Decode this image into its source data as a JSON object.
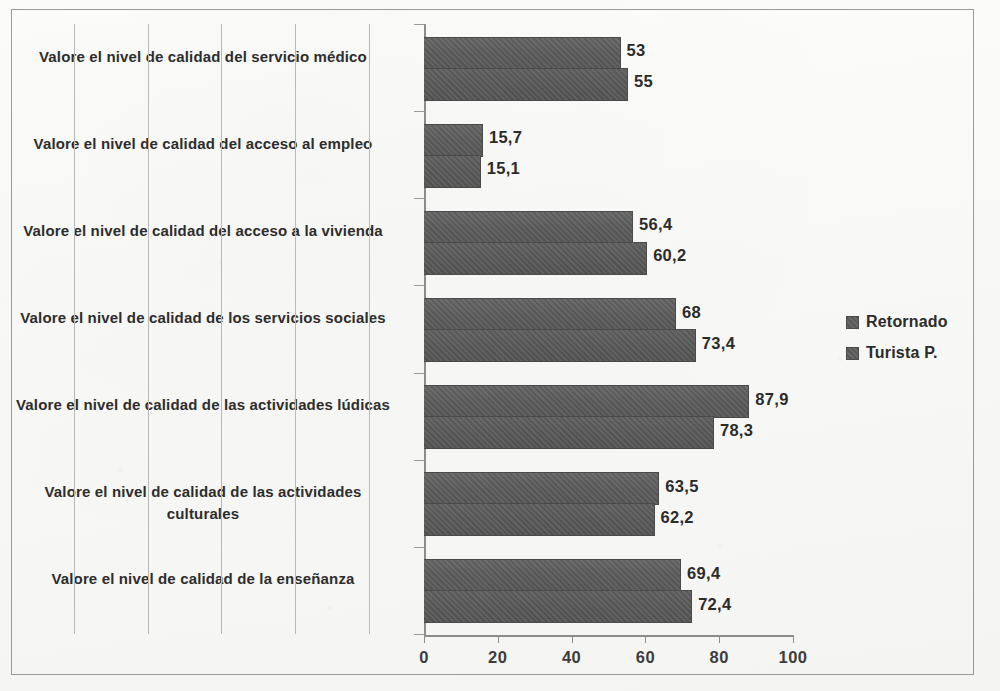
{
  "chart_data": {
    "type": "bar",
    "orientation": "horizontal",
    "title": "",
    "xlabel": "",
    "ylabel": "",
    "xlim": [
      0,
      100
    ],
    "xticks": [
      "0",
      "20",
      "40",
      "60",
      "80",
      "100"
    ],
    "grid": true,
    "legend_position": "right",
    "categories": [
      "Valore el nivel de calidad del servicio médico",
      "Valore el nivel de calidad del acceso al empleo",
      "Valore el nivel de calidad del acceso a la vivienda",
      "Valore el nivel de calidad de los servicios sociales",
      "Valore el nivel de calidad de las actividades lúdicas",
      "Valore el nivel de calidad de las actividades culturales",
      "Valore el nivel de calidad de la enseñanza"
    ],
    "series": [
      {
        "name": "Retornado",
        "color": "#5c5c5c",
        "values": [
          53,
          15.7,
          56.4,
          68,
          87.9,
          63.5,
          69.4
        ],
        "labels": [
          "53",
          "15,7",
          "56,4",
          "68",
          "87,9",
          "63,5",
          "69,4"
        ]
      },
      {
        "name": "Turista P.",
        "color": "#585858",
        "values": [
          55,
          15.1,
          60.2,
          73.4,
          78.3,
          62.2,
          72.4
        ],
        "labels": [
          "55",
          "15,1",
          "60,2",
          "73,4",
          "78,3",
          "62,2",
          "72,4"
        ]
      }
    ]
  },
  "legend": {
    "items": [
      {
        "label": "Retornado"
      },
      {
        "label": "Turista P."
      }
    ]
  }
}
